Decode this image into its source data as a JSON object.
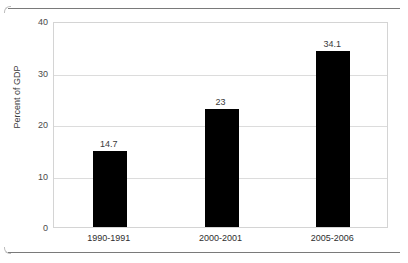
{
  "chart_data": {
    "type": "bar",
    "title": "",
    "xlabel": "",
    "ylabel": "Percent of GDP",
    "categories": [
      "1990-1991",
      "2000-2001",
      "2005-2006"
    ],
    "values": [
      14.7,
      23,
      34.1
    ],
    "value_labels": [
      "14.7",
      "23",
      "34.1"
    ],
    "ylim": [
      0,
      40
    ],
    "yticks": [
      0,
      10,
      20,
      30,
      40
    ],
    "ytick_labels": [
      "0",
      "10",
      "20",
      "30",
      "40"
    ],
    "grid": true,
    "legend": null,
    "bar_color": "#000000",
    "grid_color": "#dcdcdc",
    "frame_color": "#d4d4d4",
    "text_color": "#3a3a3a"
  }
}
